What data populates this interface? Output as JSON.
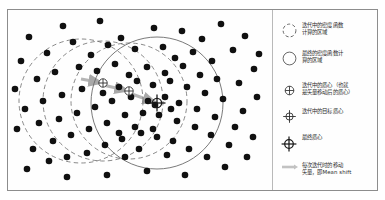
{
  "figure": {
    "background_color": "#ffffff",
    "border_color": "#8d8d8d",
    "point_color": "#101010",
    "dashed_circle_color": "#6b6b6b",
    "solid_circle_color": "#6b6b6b",
    "shift_vector_color": "#b5b5b5"
  },
  "legend": {
    "items": [
      {
        "icon": "dashed-circle-icon",
        "label": "迭代中的密度函数\n计算的区域"
      },
      {
        "icon": "solid-circle-icon",
        "label": "最终的密度函数计\n算的区域"
      },
      {
        "icon": "crosshair-inscribed-icon",
        "label": "迭代中的质心（也就\n是矢量移动后的质心）"
      },
      {
        "icon": "crosshair-extended-icon",
        "label": "迭代中的目标质心"
      },
      {
        "icon": "crosshair-final-icon",
        "label": "最终质心"
      },
      {
        "icon": "shift-vector-icon",
        "label": "每次迭代时的移动\n矢量，即Mean shift"
      }
    ]
  },
  "chart_data": {
    "type": "scatter",
    "xlabel": "",
    "ylabel": "",
    "xlim": [
      0,
      265
    ],
    "ylim": [
      0,
      180
    ],
    "grid": false,
    "legend_position": "right",
    "point_radius": 3.3,
    "points": [
      [
        22,
        28
      ],
      [
        56,
        17
      ],
      [
        93,
        12
      ],
      [
        114,
        29
      ],
      [
        147,
        19
      ],
      [
        175,
        22
      ],
      [
        195,
        30
      ],
      [
        214,
        15
      ],
      [
        238,
        27
      ],
      [
        252,
        45
      ],
      [
        14,
        52
      ],
      [
        40,
        44
      ],
      [
        66,
        33
      ],
      [
        84,
        46
      ],
      [
        101,
        36
      ],
      [
        128,
        40
      ],
      [
        156,
        38
      ],
      [
        168,
        49
      ],
      [
        186,
        43
      ],
      [
        205,
        52
      ],
      [
        226,
        41
      ],
      [
        247,
        60
      ],
      [
        8,
        80
      ],
      [
        30,
        70
      ],
      [
        48,
        63
      ],
      [
        72,
        58
      ],
      [
        90,
        62
      ],
      [
        108,
        55
      ],
      [
        122,
        66
      ],
      [
        140,
        58
      ],
      [
        158,
        64
      ],
      [
        176,
        57
      ],
      [
        193,
        66
      ],
      [
        210,
        70
      ],
      [
        232,
        74
      ],
      [
        250,
        88
      ],
      [
        18,
        100
      ],
      [
        36,
        92
      ],
      [
        55,
        86
      ],
      [
        75,
        80
      ],
      [
        96,
        84
      ],
      [
        112,
        78
      ],
      [
        130,
        72
      ],
      [
        146,
        76
      ],
      [
        163,
        72
      ],
      [
        180,
        78
      ],
      [
        198,
        84
      ],
      [
        216,
        90
      ],
      [
        236,
        102
      ],
      [
        10,
        120
      ],
      [
        32,
        114
      ],
      [
        52,
        110
      ],
      [
        70,
        104
      ],
      [
        88,
        98
      ],
      [
        105,
        92
      ],
      [
        124,
        88
      ],
      [
        141,
        92
      ],
      [
        158,
        88
      ],
      [
        172,
        94
      ],
      [
        190,
        100
      ],
      [
        208,
        108
      ],
      [
        228,
        118
      ],
      [
        246,
        128
      ],
      [
        26,
        140
      ],
      [
        46,
        132
      ],
      [
        64,
        126
      ],
      [
        82,
        120
      ],
      [
        100,
        114
      ],
      [
        118,
        106
      ],
      [
        136,
        104
      ],
      [
        152,
        106
      ],
      [
        170,
        112
      ],
      [
        188,
        118
      ],
      [
        204,
        126
      ],
      [
        222,
        136
      ],
      [
        20,
        160
      ],
      [
        42,
        152
      ],
      [
        60,
        148
      ],
      [
        80,
        144
      ],
      [
        98,
        136
      ],
      [
        115,
        130
      ],
      [
        134,
        124
      ],
      [
        150,
        128
      ],
      [
        166,
        132
      ],
      [
        182,
        140
      ],
      [
        200,
        148
      ],
      [
        218,
        158
      ],
      [
        240,
        148
      ],
      [
        60,
        168
      ],
      [
        100,
        166
      ],
      [
        140,
        162
      ],
      [
        178,
        166
      ],
      [
        118,
        148
      ],
      [
        160,
        146
      ],
      [
        132,
        140
      ],
      [
        146,
        120
      ],
      [
        128,
        118
      ],
      [
        112,
        124
      ],
      [
        164,
        100
      ],
      [
        148,
        96
      ]
    ],
    "dashed_circles": [
      {
        "cx": 74,
        "cy": 92,
        "r": 62
      },
      {
        "cx": 96,
        "cy": 92,
        "r": 60
      },
      {
        "cx": 122,
        "cy": 92,
        "r": 58
      }
    ],
    "solid_circle": {
      "cx": 150,
      "cy": 94,
      "r": 66
    },
    "centroids": [
      {
        "x": 96,
        "y": 74,
        "type": "crosshair-inscribed"
      },
      {
        "x": 122,
        "y": 82,
        "type": "crosshair-inscribed"
      },
      {
        "x": 150,
        "y": 94,
        "type": "crosshair-final"
      }
    ],
    "shift_vectors": [
      {
        "x1": 74,
        "y1": 70,
        "x2": 96,
        "y2": 74
      },
      {
        "x1": 96,
        "y1": 76,
        "x2": 122,
        "y2": 82
      },
      {
        "x1": 122,
        "y1": 84,
        "x2": 150,
        "y2": 94
      }
    ]
  }
}
